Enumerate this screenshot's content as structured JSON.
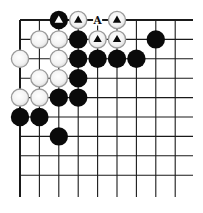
{
  "diagram": {
    "type": "go-board-corner",
    "visible_columns": 9,
    "visible_rows": 9,
    "edges": [
      "top",
      "left"
    ],
    "colors": {
      "line": "#1a1a1a",
      "black_stone": "#0a0a0a",
      "white_stone_fill": "#f4f4f4",
      "white_stone_edge": "#9a9a9a",
      "background": "#ffffff"
    },
    "stones": [
      {
        "col": 2,
        "row": 0,
        "color": "black",
        "marker": "triangle"
      },
      {
        "col": 3,
        "row": 0,
        "color": "white",
        "marker": "triangle"
      },
      {
        "col": 5,
        "row": 0,
        "color": "white",
        "marker": "triangle"
      },
      {
        "col": 1,
        "row": 1,
        "color": "white"
      },
      {
        "col": 2,
        "row": 1,
        "color": "white"
      },
      {
        "col": 3,
        "row": 1,
        "color": "black"
      },
      {
        "col": 4,
        "row": 1,
        "color": "white",
        "marker": "triangle"
      },
      {
        "col": 5,
        "row": 1,
        "color": "white",
        "marker": "triangle"
      },
      {
        "col": 7,
        "row": 1,
        "color": "black"
      },
      {
        "col": 0,
        "row": 2,
        "color": "white"
      },
      {
        "col": 2,
        "row": 2,
        "color": "white"
      },
      {
        "col": 3,
        "row": 2,
        "color": "black"
      },
      {
        "col": 4,
        "row": 2,
        "color": "black"
      },
      {
        "col": 5,
        "row": 2,
        "color": "black"
      },
      {
        "col": 6,
        "row": 2,
        "color": "black"
      },
      {
        "col": 1,
        "row": 3,
        "color": "white"
      },
      {
        "col": 2,
        "row": 3,
        "color": "white"
      },
      {
        "col": 3,
        "row": 3,
        "color": "black"
      },
      {
        "col": 0,
        "row": 4,
        "color": "white"
      },
      {
        "col": 1,
        "row": 4,
        "color": "white"
      },
      {
        "col": 2,
        "row": 4,
        "color": "black"
      },
      {
        "col": 3,
        "row": 4,
        "color": "black"
      },
      {
        "col": 0,
        "row": 5,
        "color": "black"
      },
      {
        "col": 1,
        "row": 5,
        "color": "black"
      },
      {
        "col": 2,
        "row": 6,
        "color": "black"
      }
    ],
    "labels": [
      {
        "col": 4,
        "row": 0,
        "text": "A"
      }
    ]
  }
}
